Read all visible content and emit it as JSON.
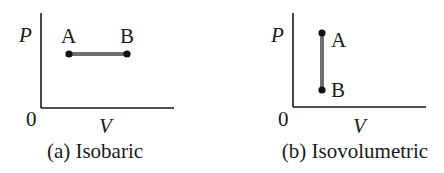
{
  "panels": [
    {
      "id": "a",
      "caption": "(a) Isobaric",
      "y_axis_label": "P",
      "x_axis_label": "V",
      "origin_label": "0",
      "process": "isobaric",
      "points": [
        {
          "label": "A"
        },
        {
          "label": "B"
        }
      ]
    },
    {
      "id": "b",
      "caption": "(b) Isovolumetric",
      "y_axis_label": "P",
      "x_axis_label": "V",
      "origin_label": "0",
      "process": "isovolumetric",
      "points": [
        {
          "label": "A"
        },
        {
          "label": "B"
        }
      ]
    }
  ],
  "colors": {
    "axis": "#1a1a1a",
    "process_line": "#6e6e6e",
    "point": "#111111"
  }
}
